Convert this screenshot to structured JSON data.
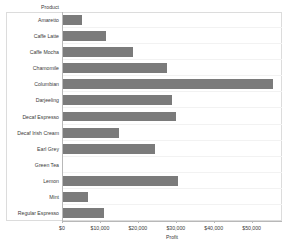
{
  "chart_data": {
    "type": "bar",
    "orientation": "horizontal",
    "title": "",
    "xlabel": "Profit",
    "ylabel": "Product",
    "categories": [
      "Amaretto",
      "Caffe Latte",
      "Caffe Mocha",
      "Chamomile",
      "Columbian",
      "Darjeeling",
      "Decaf Espresso",
      "Decaf Irish Cream",
      "Earl Grey",
      "Green Tea",
      "Lemon",
      "Mint",
      "Regular Espresso"
    ],
    "values": [
      5200,
      11500,
      18700,
      27600,
      55700,
      28900,
      30000,
      15000,
      24400,
      200,
      30500,
      6800,
      11000
    ],
    "xlim": [
      0,
      58000
    ],
    "xticks": [
      0,
      10000,
      20000,
      30000,
      40000,
      50000
    ],
    "xtick_labels": [
      "$0",
      "$10,000",
      "$20,000",
      "$30,000",
      "$40,000",
      "$50,000"
    ],
    "grid": false,
    "legend": null,
    "bar_color": "#7b7b7b",
    "axis_color": "#b8b8b8",
    "frame_color": "#dcdcdc",
    "background": "#ffffff"
  },
  "axes": {
    "row_header_title": "Product",
    "value_axis_title": "Profit"
  }
}
